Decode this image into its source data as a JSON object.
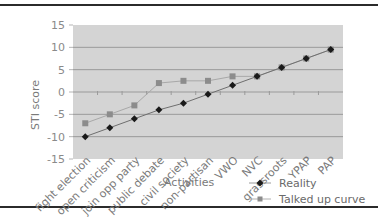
{
  "chart_data": {
    "type": "line",
    "title": "",
    "xlabel": "Activities",
    "ylabel": "STI score",
    "ylim": [
      -15,
      15
    ],
    "yticks": [
      15,
      10,
      5,
      0,
      -5,
      -10,
      -15
    ],
    "grid": true,
    "legend_position": "bottom-right",
    "categories": [
      "fight election",
      "open criticism",
      "join opp party",
      "public debate",
      "civil society",
      "non-partisan",
      "VWO",
      "NVC",
      "grassroots",
      "YPAP",
      "PAP"
    ],
    "series": [
      {
        "name": "Reality",
        "marker": "diamond",
        "color": "#1a1a1a",
        "values": [
          -10,
          -8,
          -6,
          -4,
          -2.5,
          -0.5,
          1.5,
          3.5,
          5.5,
          7.5,
          9.5
        ]
      },
      {
        "name": "Talked up curve",
        "marker": "square",
        "color": "#8c8c8c",
        "values": [
          -7,
          -5,
          -3,
          2,
          2.5,
          2.5,
          3.5,
          3.5,
          5.5,
          7.5,
          9.5
        ]
      }
    ]
  },
  "axis": {
    "ylabel": "STI score",
    "xlabel": "Activities"
  },
  "legend": {
    "reality": "Reality",
    "talked": "Talked up curve"
  },
  "colors": {
    "plot_bg": "#d4d4d4",
    "gridline": "#9a9a9a",
    "reality": "#1a1a1a",
    "talked": "#8c8c8c"
  }
}
